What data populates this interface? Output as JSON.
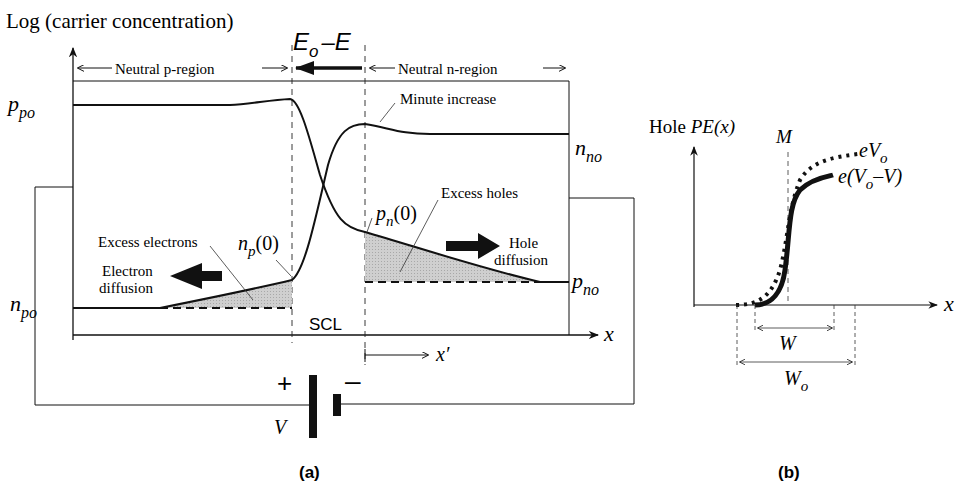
{
  "panel_a": {
    "y_axis_label": "Log (carrier concentration)",
    "field_label_main": "E",
    "field_label_sub": "o",
    "field_label_minus": "–E",
    "neutral_p": "Neutral p-region",
    "neutral_n": "Neutral n-region",
    "minute_increase": "Minute increase",
    "ppo_main": "p",
    "ppo_sub": "po",
    "nno_main": "n",
    "nno_sub": "no",
    "npo_main": "n",
    "npo_sub": "po",
    "pno_main": "p",
    "pno_sub": "no",
    "np0_main": "n",
    "np0_sub": "p",
    "np0_arg": "(0)",
    "pn0_main": "p",
    "pn0_sub": "n",
    "pn0_arg": "(0)",
    "excess_electrons": "Excess electrons",
    "excess_holes": "Excess holes",
    "electron_diffusion_1": "Electron",
    "electron_diffusion_2": "diffusion",
    "hole_diffusion_1": "Hole",
    "hole_diffusion_2": "diffusion",
    "scl": "SCL",
    "x_axis": "x",
    "x_prime": "x′",
    "battery_plus": "+",
    "battery_minus": "–",
    "battery_label": "V",
    "caption": "(a)"
  },
  "panel_b": {
    "y_axis_label_1": "Hole ",
    "y_axis_label_2": "PE(x)",
    "m_label": "M",
    "ev0_main": "eV",
    "ev0_sub": "o",
    "evv_1": "e(V",
    "evv_sub": "o",
    "evv_2": "–V)",
    "x_axis": "x",
    "w_label": "W",
    "w0_main": "W",
    "w0_sub": "o",
    "caption": "(b)"
  },
  "colors": {
    "line": "#111111",
    "shade": "#c8c8c8",
    "thin": "#333333"
  }
}
